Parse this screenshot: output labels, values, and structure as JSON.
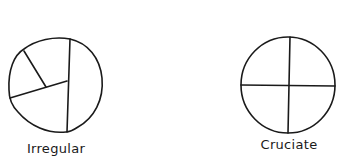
{
  "diagrams": [
    {
      "name": "irregular",
      "label": "Irregular",
      "description": "Circle divided by irregular lines into unequal segments"
    },
    {
      "name": "cruciate",
      "label": "Cruciate",
      "description": "Circle divided into four quadrants by a cross"
    }
  ],
  "colors": {
    "stroke": "#1a1a1a",
    "background": "#ffffff"
  }
}
